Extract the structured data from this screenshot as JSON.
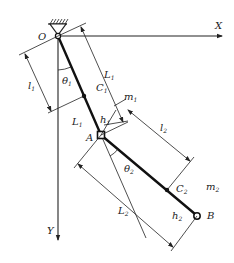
{
  "diagram": {
    "axes": {
      "x_label": "X",
      "y_label": "Y",
      "origin_label": "O"
    },
    "joints": {
      "a_label": "A",
      "b_label": "B"
    },
    "centers_of_mass": {
      "c1": {
        "main": "C",
        "sub": "1"
      },
      "c2": {
        "main": "C",
        "sub": "2"
      }
    },
    "masses": {
      "m1": {
        "main": "m",
        "sub": "1"
      },
      "m2": {
        "main": "m",
        "sub": "2"
      }
    },
    "angles": {
      "theta1": {
        "main": "θ",
        "sub": "1"
      },
      "theta2": {
        "main": "θ",
        "sub": "2"
      }
    },
    "dimensions": {
      "l1": {
        "main": "l",
        "sub": "1"
      },
      "l2": {
        "main": "l",
        "sub": "2"
      },
      "L1_long": {
        "main": "L",
        "sub": "1"
      },
      "L1_short": {
        "main": "L",
        "sub": "1"
      },
      "L2": {
        "main": "L",
        "sub": "2"
      },
      "h1": {
        "main": "h",
        "sub": "1"
      },
      "h2": {
        "main": "h",
        "sub": "2"
      }
    },
    "colors": {
      "ink": "#222222",
      "background": "#ffffff"
    }
  }
}
